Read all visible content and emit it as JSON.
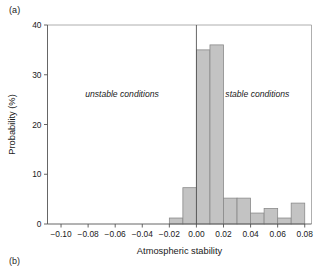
{
  "panel": {
    "label": "(a)",
    "next_label": "(b)"
  },
  "chart_data": {
    "type": "bar",
    "title": "",
    "subtitle": "",
    "xlabel": "Atmospheric stability",
    "ylabel": "Probability (%)",
    "xlim": [
      -0.11,
      0.085
    ],
    "ylim": [
      0,
      40
    ],
    "grid": false,
    "legend": "none",
    "bin_width": 0.01,
    "bin_starts": [
      -0.02,
      -0.01,
      0.0,
      0.01,
      0.02,
      0.03,
      0.04,
      0.05,
      0.06,
      0.07
    ],
    "bin_centers": [
      -0.015,
      -0.005,
      0.005,
      0.015,
      0.025,
      0.035,
      0.045,
      0.055,
      0.065,
      0.075
    ],
    "categories": [
      "-0.02",
      "-0.01",
      "0.00",
      "0.01",
      "0.02",
      "0.03",
      "0.04",
      "0.05",
      "0.06",
      "0.07"
    ],
    "values": [
      1.2,
      7.3,
      35.0,
      36.0,
      5.2,
      5.2,
      2.2,
      3.1,
      1.2,
      4.2
    ],
    "xticks": [
      -0.1,
      -0.08,
      -0.06,
      -0.04,
      -0.02,
      0.0,
      0.02,
      0.04,
      0.06,
      0.08
    ],
    "xtick_labels": [
      "−0.10",
      "−0.08",
      "−0.06",
      "−0.04",
      "−0.02",
      "0.00",
      "0.02",
      "0.04",
      "0.06",
      "0.08"
    ],
    "yticks": [
      0,
      10,
      20,
      30,
      40
    ],
    "ytick_labels": [
      "0",
      "10",
      "20",
      "30",
      "40"
    ],
    "reference_line_x": 0.0,
    "annotations": [
      {
        "text": "unstable conditions",
        "x": -0.055,
        "y": 25.5
      },
      {
        "text": "stable conditions",
        "x": 0.045,
        "y": 25.5
      }
    ],
    "colors": {
      "bar_fill": "#c3c3c3",
      "bar_stroke": "#8a8a8a",
      "axis": "#555555",
      "frame": "#9a9a9a",
      "text": "#1a1a1a"
    }
  }
}
